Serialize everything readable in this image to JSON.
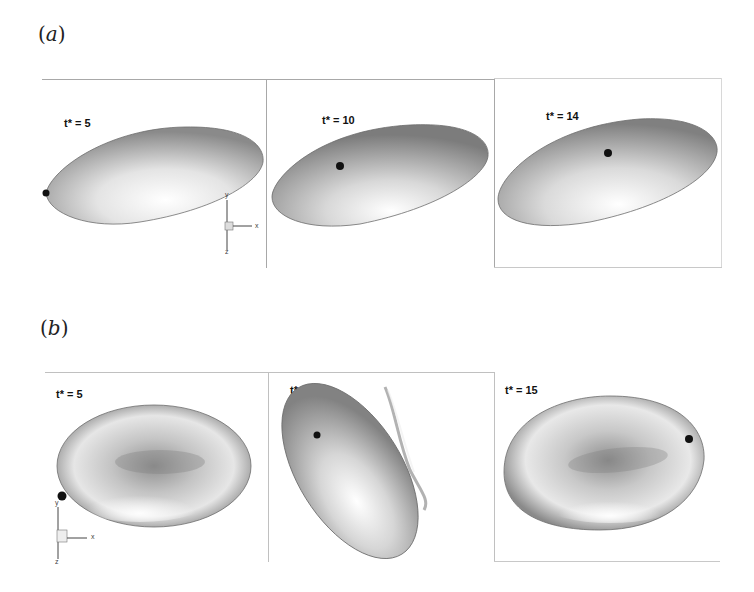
{
  "figure": {
    "panels": [
      {
        "id": "a",
        "label": "a",
        "frames": [
          {
            "time_label": "t* = 5",
            "shape": "prolate-ellipsoid"
          },
          {
            "time_label": "t* = 10",
            "shape": "prolate-ellipsoid"
          },
          {
            "time_label": "t* = 14",
            "shape": "prolate-ellipsoid"
          }
        ],
        "axes_triad": {
          "x": "x",
          "y": "y",
          "z": "z"
        }
      },
      {
        "id": "b",
        "label": "b",
        "frames": [
          {
            "time_label": "t* = 5",
            "shape": "biconcave-disk"
          },
          {
            "time_label": "t* = 10",
            "shape": "biconcave-disk-tilted"
          },
          {
            "time_label": "t* = 15",
            "shape": "biconcave-disk"
          }
        ],
        "axes_triad": {
          "x": "x",
          "y": "y",
          "z": "z"
        }
      }
    ],
    "colors": {
      "frame_line": "#a8a8a8",
      "marker": "#111111",
      "cell_dark": "#7a7a7a",
      "cell_light": "#f2f2f2"
    }
  }
}
